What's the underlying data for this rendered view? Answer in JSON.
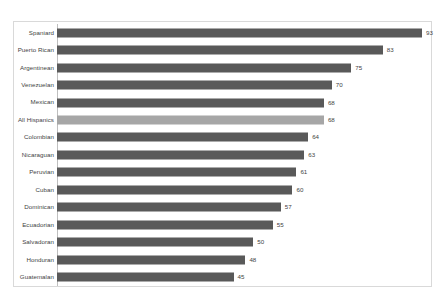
{
  "chart_data": {
    "type": "bar",
    "orientation": "horizontal",
    "title": "",
    "subtitle": "",
    "xlabel": "",
    "ylabel": "",
    "xlim": [
      0,
      100
    ],
    "grid": false,
    "legend": null,
    "categories": [
      "Spaniard",
      "Puerto Rican",
      "Argentinean",
      "Venezuelan",
      "Mexican",
      "All Hispanics",
      "Colombian",
      "Nicaraguan",
      "Peruvian",
      "Cuban",
      "Dominican",
      "Ecuadorian",
      "Salvadoran",
      "Honduran",
      "Guatemalan"
    ],
    "values": [
      93,
      83,
      75,
      70,
      68,
      68,
      64,
      63,
      61,
      60,
      57,
      55,
      50,
      48,
      45
    ],
    "data_labels": [
      "93",
      "83",
      "75",
      "70",
      "68",
      "68",
      "64",
      "63",
      "61",
      "60",
      "57",
      "55",
      "50",
      "48",
      "45"
    ],
    "highlight_category": "All Hispanics",
    "axis_tick_labels": [],
    "annotations": []
  },
  "style": {
    "bar_color": "#595959",
    "highlight_bar_color": "#a6a6a6",
    "frame_border_color": "#d9d9d9",
    "axis_line_color": "#bfbfbf",
    "label_color": "#3f3f3f",
    "background_color": "#ffffff"
  }
}
